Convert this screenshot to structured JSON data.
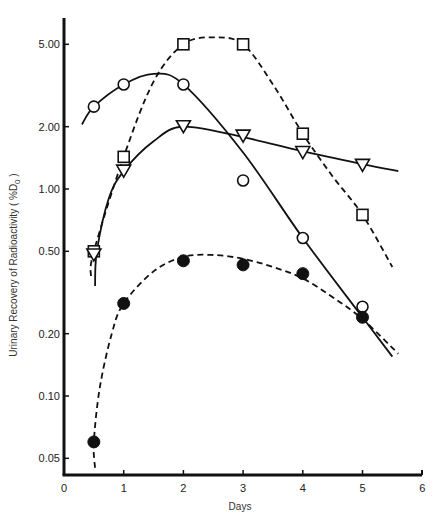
{
  "chart_data": {
    "type": "line",
    "title": "",
    "xlabel": "Days",
    "ylabel": "Urinary Recovery of Radioactivity ( %D",
    "ylabel_subscript": "0",
    "ylabel_close": " )",
    "xscale": "linear",
    "yscale": "log",
    "xlim": [
      0,
      6
    ],
    "ylim": [
      0.04,
      7.0
    ],
    "x_ticks": [
      0,
      1,
      2,
      3,
      4,
      5,
      6
    ],
    "x_tick_labels": [
      "0",
      "1",
      "2",
      "3",
      "4",
      "5",
      "6"
    ],
    "y_ticks": [
      0.05,
      0.1,
      0.2,
      0.5,
      1.0,
      2.0,
      5.0
    ],
    "y_tick_labels": [
      "0.05",
      "0.10",
      "0.20",
      "0.50",
      "1.00",
      "2.00",
      "5.00"
    ],
    "grid": false,
    "legend": null,
    "series": [
      {
        "name": "open-circles",
        "marker": "open-circle",
        "line": "solid",
        "x": [
          0.5,
          1,
          2,
          3,
          4,
          5
        ],
        "values": [
          2.5,
          3.2,
          3.2,
          1.1,
          0.58,
          0.27
        ],
        "curve": [
          [
            0.3,
            2.05
          ],
          [
            0.5,
            2.5
          ],
          [
            1,
            3.2
          ],
          [
            1.5,
            3.6
          ],
          [
            2,
            3.2
          ],
          [
            3,
            1.5
          ],
          [
            4,
            0.58
          ],
          [
            5,
            0.24
          ],
          [
            5.5,
            0.155
          ]
        ]
      },
      {
        "name": "open-squares",
        "marker": "open-square",
        "line": "dashed",
        "x": [
          0.5,
          1,
          2,
          3,
          4,
          5
        ],
        "values": [
          0.5,
          1.43,
          5.0,
          5.0,
          1.85,
          0.75
        ],
        "curve": [
          [
            0.45,
            0.38
          ],
          [
            0.5,
            0.5
          ],
          [
            1,
            1.43
          ],
          [
            1.5,
            3.3
          ],
          [
            2,
            5.0
          ],
          [
            2.5,
            5.4
          ],
          [
            3,
            5.0
          ],
          [
            3.5,
            3.2
          ],
          [
            4,
            1.85
          ],
          [
            4.5,
            1.15
          ],
          [
            5,
            0.75
          ],
          [
            5.5,
            0.42
          ]
        ]
      },
      {
        "name": "open-triangles",
        "marker": "open-triangle-down",
        "line": "solid",
        "x": [
          0.5,
          1,
          2,
          3,
          4,
          5
        ],
        "values": [
          0.48,
          1.22,
          2.0,
          1.8,
          1.5,
          1.3
        ],
        "curve": [
          [
            0.52,
            0.34
          ],
          [
            0.55,
            0.5
          ],
          [
            0.75,
            0.9
          ],
          [
            1,
            1.22
          ],
          [
            1.5,
            1.7
          ],
          [
            2,
            2.0
          ],
          [
            3,
            1.78
          ],
          [
            4,
            1.52
          ],
          [
            5,
            1.32
          ],
          [
            5.6,
            1.22
          ]
        ]
      },
      {
        "name": "filled-circles",
        "marker": "filled-circle",
        "line": "dashed",
        "x": [
          0.5,
          1,
          2,
          3,
          4,
          5
        ],
        "values": [
          0.06,
          0.28,
          0.45,
          0.43,
          0.39,
          0.24
        ],
        "curve": [
          [
            0.52,
            0.045
          ],
          [
            0.5,
            0.06
          ],
          [
            0.6,
            0.11
          ],
          [
            0.8,
            0.2
          ],
          [
            1,
            0.28
          ],
          [
            1.5,
            0.4
          ],
          [
            2,
            0.47
          ],
          [
            2.5,
            0.48
          ],
          [
            3,
            0.46
          ],
          [
            3.5,
            0.42
          ],
          [
            4,
            0.37
          ],
          [
            4.5,
            0.3
          ],
          [
            5,
            0.235
          ],
          [
            5.6,
            0.16
          ]
        ]
      }
    ]
  },
  "layout": {
    "plot_left": 64,
    "plot_right": 422,
    "axis_bottom": 475,
    "axis_top": 18,
    "y_px_at_1": 189,
    "y_px_per_decade": 207,
    "x_px_per_day": 59.7,
    "ink_color": "#111111"
  }
}
